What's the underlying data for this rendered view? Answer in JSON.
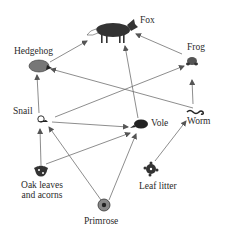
{
  "diagram": {
    "type": "food-web",
    "nodes": [
      {
        "id": "fox",
        "label": "Fox",
        "icon": "fox-icon"
      },
      {
        "id": "hedgehog",
        "label": "Hedgehog",
        "icon": "hedgehog-icon"
      },
      {
        "id": "frog",
        "label": "Frog",
        "icon": "frog-icon"
      },
      {
        "id": "snail",
        "label": "Snail",
        "icon": "snail-icon"
      },
      {
        "id": "vole",
        "label": "Vole",
        "icon": "vole-icon"
      },
      {
        "id": "worm",
        "label": "Worm",
        "icon": "worm-icon"
      },
      {
        "id": "oak",
        "label_line1": "Oak leaves",
        "label_line2": "and acorns",
        "icon": "oak-leaves-icon"
      },
      {
        "id": "primrose",
        "label": "Primrose",
        "icon": "primrose-icon"
      },
      {
        "id": "leaflitter",
        "label": "Leaf litter",
        "icon": "leaf-litter-icon"
      }
    ],
    "edges": [
      {
        "from": "hedgehog",
        "to": "fox"
      },
      {
        "from": "frog",
        "to": "fox"
      },
      {
        "from": "vole",
        "to": "fox"
      },
      {
        "from": "worm",
        "to": "hedgehog"
      },
      {
        "from": "snail",
        "to": "hedgehog"
      },
      {
        "from": "snail",
        "to": "frog"
      },
      {
        "from": "worm",
        "to": "frog"
      },
      {
        "from": "snail",
        "to": "vole"
      },
      {
        "from": "oak",
        "to": "snail"
      },
      {
        "from": "oak",
        "to": "vole"
      },
      {
        "from": "primrose",
        "to": "snail"
      },
      {
        "from": "primrose",
        "to": "vole"
      },
      {
        "from": "leaflitter",
        "to": "worm"
      }
    ]
  },
  "colors": {
    "line": "#6a6a6a",
    "ink": "#2a2a2a"
  }
}
